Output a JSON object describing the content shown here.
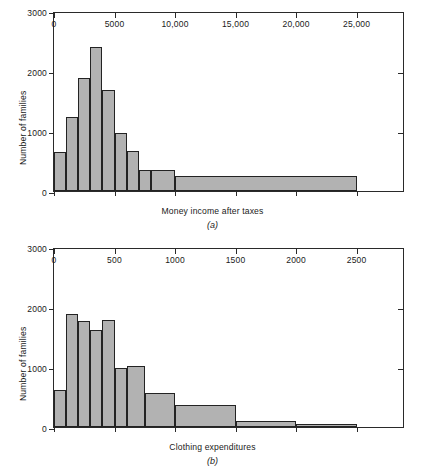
{
  "figure": {
    "panels": [
      {
        "letter": "(a)",
        "chart_data": {
          "type": "bar",
          "title": "",
          "subtitle": "",
          "xlabel": "Money income after taxes",
          "ylabel": "Number of families",
          "xlim": [
            0,
            29000
          ],
          "ylim": [
            0,
            3000
          ],
          "grid": false,
          "legend": "none",
          "xticks": [
            0,
            5000,
            10000,
            15000,
            20000,
            25000
          ],
          "xtick_labels": [
            "0",
            "5000",
            "10,000",
            "15,000",
            "20,000",
            "25,000"
          ],
          "yticks": [
            0,
            1000,
            2000,
            3000
          ],
          "ytick_labels": [
            "0",
            "1000",
            "2000",
            "3000"
          ],
          "bin_edges": [
            0,
            1000,
            2000,
            3000,
            4000,
            5000,
            6000,
            7000,
            8000,
            10000,
            25000
          ],
          "categories": [
            "0-1000",
            "1000-2000",
            "2000-3000",
            "3000-4000",
            "4000-5000",
            "5000-6000",
            "6000-7000",
            "7000-8000",
            "8000-10000",
            "10000-25000"
          ],
          "values": [
            650,
            1230,
            1880,
            2400,
            1680,
            960,
            660,
            350,
            350,
            250
          ]
        }
      },
      {
        "letter": "(b)",
        "chart_data": {
          "type": "bar",
          "title": "",
          "subtitle": "",
          "xlabel": "Clothing expenditures",
          "ylabel": "Number of families",
          "xlim": [
            0,
            2900
          ],
          "ylim": [
            0,
            3000
          ],
          "grid": false,
          "legend": "none",
          "xticks": [
            0,
            500,
            1000,
            1500,
            2000,
            2500
          ],
          "xtick_labels": [
            "0",
            "500",
            "1000",
            "1500",
            "2000",
            "2500"
          ],
          "yticks": [
            0,
            1000,
            2000,
            3000
          ],
          "ytick_labels": [
            "0",
            "1000",
            "2000",
            "3000"
          ],
          "bin_edges": [
            0,
            100,
            200,
            300,
            400,
            500,
            600,
            750,
            1000,
            1500,
            2000,
            2500
          ],
          "categories": [
            "0-100",
            "100-200",
            "200-300",
            "300-400",
            "400-500",
            "500-600",
            "600-750",
            "750-1000",
            "1000-1500",
            "1500-2000",
            "2000-2500"
          ],
          "values": [
            620,
            1890,
            1760,
            1610,
            1790,
            980,
            1020,
            560,
            360,
            100,
            50
          ]
        }
      }
    ],
    "style": {
      "bar_fill": "#b2b2b2",
      "bar_stroke": "#232323",
      "axis_color": "#2a2a2a",
      "background": "#ffffff",
      "text_color": "#1a1a1a"
    }
  }
}
